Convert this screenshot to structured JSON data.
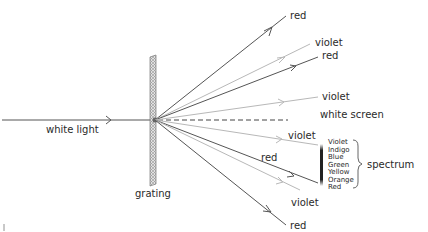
{
  "diagram": {
    "labels": {
      "white_light": "white light",
      "grating": "grating",
      "white_screen": "white screen",
      "spectrum": "spectrum",
      "red_top": "red",
      "violet_upper1": "violet",
      "red_upper1": "red",
      "violet_upper0": "violet",
      "violet_lower0": "violet",
      "red_lower1": "red",
      "violet_lower1": "violet",
      "red_bottom": "red"
    },
    "spectrum_colors": [
      "Violet",
      "Indigo",
      "Blue",
      "Green",
      "Yellow",
      "Orange",
      "Red"
    ],
    "colors": {
      "dark_ray": "#555555",
      "light_ray": "#b8b8b8",
      "text": "#2a2a2a",
      "grating_fill": "#cfcfcf"
    }
  }
}
